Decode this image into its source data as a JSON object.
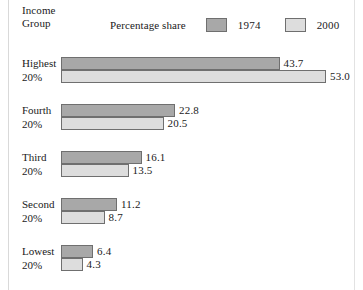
{
  "chart_data": {
    "type": "bar",
    "title": "",
    "subtitle": "",
    "orientation": "horizontal",
    "grouped": true,
    "xlabel": "",
    "ylabel": "Income Group",
    "legend_title": "Percentage share",
    "legend_position": "top",
    "grid": false,
    "xlim": [
      0,
      53.0
    ],
    "categories": [
      "Highest 20%",
      "Fourth 20%",
      "Third 20%",
      "Second 20%",
      "Lowest 20%"
    ],
    "category_lines": [
      [
        "Highest",
        "20%"
      ],
      [
        "Fourth",
        "20%"
      ],
      [
        "Third",
        "20%"
      ],
      [
        "Second",
        "20%"
      ],
      [
        "Lowest",
        "20%"
      ]
    ],
    "series": [
      {
        "name": "1974",
        "color": "#a8a8a8",
        "values": [
          43.7,
          22.8,
          16.1,
          11.2,
          6.4
        ],
        "labels": [
          "43.7",
          "22.8",
          "16.1",
          "11.2",
          "6.4"
        ]
      },
      {
        "name": "2000",
        "color": "#dddddd",
        "values": [
          53.0,
          20.5,
          13.5,
          8.7,
          4.3
        ],
        "labels": [
          "53.0",
          "20.5",
          "13.5",
          "8.7",
          "4.3"
        ]
      }
    ]
  },
  "axis": {
    "y_title_line1": "Income",
    "y_title_line2": "Group"
  },
  "legend": {
    "caption": "Percentage share",
    "items": [
      {
        "label": "1974",
        "color": "#a8a8a8"
      },
      {
        "label": "2000",
        "color": "#dddddd"
      }
    ]
  },
  "groups": [
    {
      "name_line1": "Highest",
      "name_line2": "20%",
      "bar_1974": {
        "label": "43.7",
        "value": 43.7
      },
      "bar_2000": {
        "label": "53.0",
        "value": 53.0
      }
    },
    {
      "name_line1": "Fourth",
      "name_line2": "20%",
      "bar_1974": {
        "label": "22.8",
        "value": 22.8
      },
      "bar_2000": {
        "label": "20.5",
        "value": 20.5
      }
    },
    {
      "name_line1": "Third",
      "name_line2": "20%",
      "bar_1974": {
        "label": "16.1",
        "value": 16.1
      },
      "bar_2000": {
        "label": "13.5",
        "value": 13.5
      }
    },
    {
      "name_line1": "Second",
      "name_line2": "20%",
      "bar_1974": {
        "label": "11.2",
        "value": 11.2
      },
      "bar_2000": {
        "label": "8.7",
        "value": 8.7
      }
    },
    {
      "name_line1": "Lowest",
      "name_line2": "20%",
      "bar_1974": {
        "label": "6.4",
        "value": 6.4
      },
      "bar_2000": {
        "label": "4.3",
        "value": 4.3
      }
    }
  ],
  "scale": {
    "px_per_unit": 5.0,
    "bar_origin_x": 61,
    "value_label_gap": 4
  }
}
